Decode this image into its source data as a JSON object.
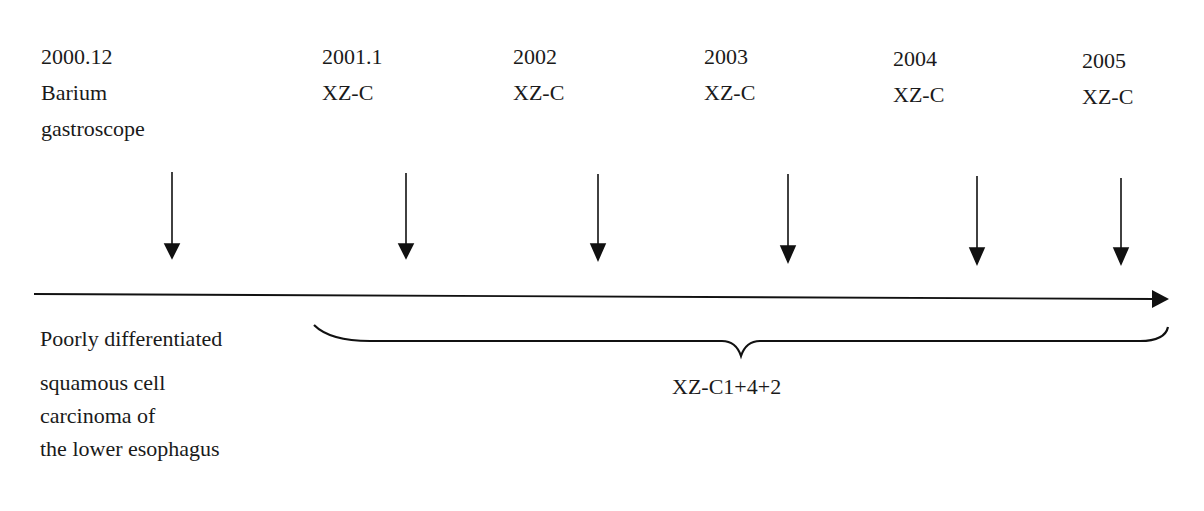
{
  "timeline": {
    "events": [
      {
        "date": "2000.12",
        "line1": "Barium",
        "line2": "gastroscope"
      },
      {
        "date": "2001.1",
        "line1": "XZ-C",
        "line2": ""
      },
      {
        "date": "2002",
        "line1": "XZ-C",
        "line2": ""
      },
      {
        "date": "2003",
        "line1": "XZ-C",
        "line2": ""
      },
      {
        "date": "2004",
        "line1": "XZ-C",
        "line2": ""
      },
      {
        "date": "2005",
        "line1": "XZ-C",
        "line2": ""
      }
    ],
    "diagnosis": [
      "Poorly differentiated",
      "squamous cell",
      "carcinoma of",
      "the lower esophagus"
    ],
    "brace_label": "XZ-C1+4+2"
  },
  "colors": {
    "line": "#111111",
    "text": "#1a1a1a",
    "background": "#ffffff"
  }
}
